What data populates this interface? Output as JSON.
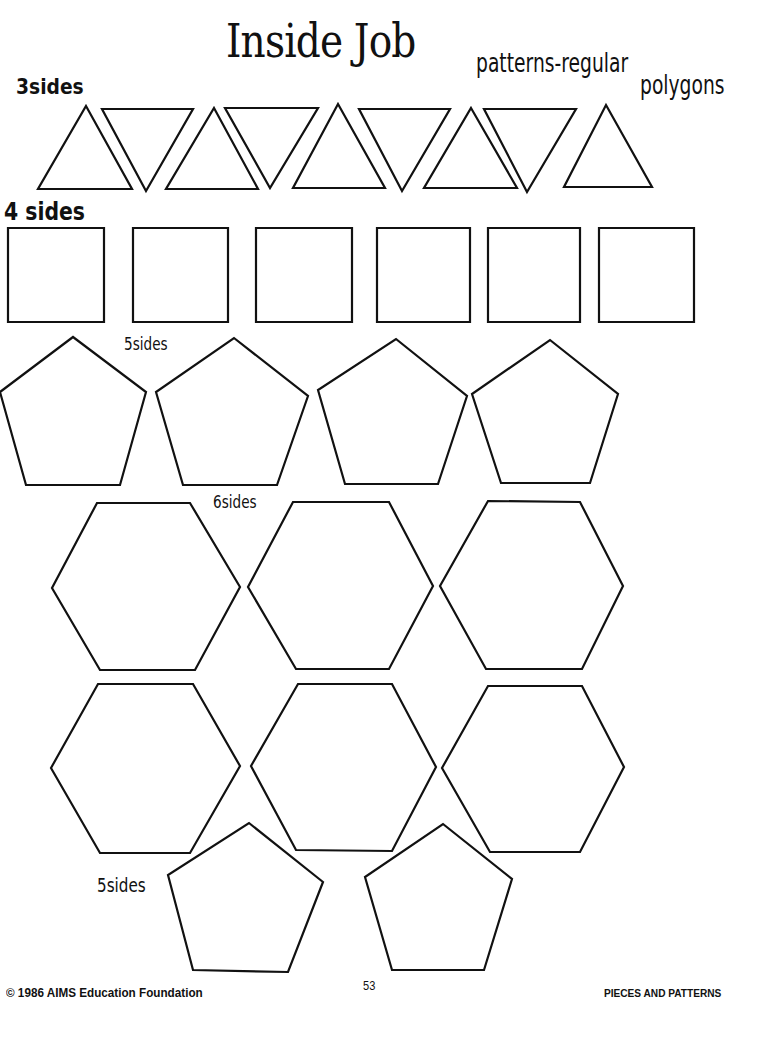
{
  "header": {
    "title": "Inside Job",
    "subtitle_line1": "patterns-regular",
    "subtitle_line2": "polygons"
  },
  "labels": {
    "three_sides": "3sides",
    "four_sides": "4 sides",
    "five_sides_top": "5sides",
    "six_sides": "6sides",
    "five_sides_bottom": "5sides"
  },
  "footer": {
    "copyright": "© 1986 AIMS Education Foundation",
    "page_number": "53",
    "book_title": "PIECES AND PATTERNS"
  },
  "shapes": {
    "triangles": [
      "86,106 132,189 38,189",
      "102,109 193,109 146,191",
      "214,108 258,189 166,189",
      "225,108 318,108 270,188",
      "338,104 385,188 293,188",
      "359,109 450,109 402,191",
      "471,108 517,188 424,188",
      "484,109 576,109 527,192",
      "606,105 652,187 564,187"
    ],
    "squares": [
      "8,228 104,228 104,322 8,322",
      "133,228 228,228 228,322 133,322",
      "256,228 352,228 352,322 256,322",
      "377,228 470,228 470,322 377,322",
      "488,228 580,228 580,322 488,322",
      "599,228 694,228 694,322 599,322"
    ],
    "pentagons_top": [
      "73,337 146,392 120,485 26,485 0,392",
      "234,338 308,396 277,485 183,485 156,392",
      "396,339 467,396 438,484 345,484 318,390",
      "550,340 618,394 590,483 501,483 472,394"
    ],
    "hexagons_row1": [
      "97,503 190,503 240,587 195,670 100,670 52,588",
      "293,502 389,502 433,586 389,669 296,669 248,587",
      "488,501 580,502 623,586 582,669 486,669 440,586"
    ],
    "hexagons_row2": [
      "98,684 193,684 240,766 190,853 100,853 51,768",
      "298,684 392,684 436,767 392,851 296,850 251,766",
      "488,686 582,686 624,767 580,852 490,852 442,768"
    ],
    "pentagons_bottom": [
      "249,823 323,882 288,972 193,970 168,875",
      "443,824 512,879 484,970 392,970 365,877"
    ]
  }
}
